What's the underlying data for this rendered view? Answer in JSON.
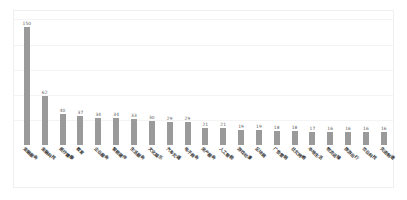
{
  "chart_data": {
    "type": "bar",
    "title": "",
    "subtitle": "",
    "xlabel": "",
    "ylabel": "",
    "ylim": [
      0,
      160
    ],
    "grid": true,
    "legend": false,
    "orientation": "vertical",
    "bar_color": "#9a9a9a",
    "label_rotation_deg": 45,
    "categories": [
      "金融服务",
      "金融科技",
      "医疗健康",
      "教育",
      "企业服务",
      "智能硬件",
      "生活服务",
      "文化娱乐",
      "汽车交通",
      "电子商务",
      "房产服务",
      "人工智能",
      "游戏动漫",
      "区块链",
      "广告营销",
      "社交网络",
      "本地生活",
      "物流运输",
      "旅游出行",
      "农业科技",
      "先进制造"
    ],
    "values": [
      150,
      62,
      40,
      37,
      34,
      34,
      33,
      30,
      29,
      29,
      21,
      21,
      19,
      19,
      18,
      18,
      17,
      16,
      16,
      16,
      16
    ],
    "value_labels": [
      "150",
      "62",
      "40",
      "37",
      "34",
      "34",
      "33",
      "30",
      "29",
      "29",
      "21",
      "21",
      "19",
      "19",
      "18",
      "18",
      "17",
      "16",
      "16",
      "16",
      "16"
    ],
    "gridline_values": [
      150,
      120,
      90,
      60,
      30
    ],
    "accent_colors": {
      "bar": "#9a9a9a",
      "grid": "#f4f4f4",
      "frame": "#efefef",
      "value_text": "#5c5c5c",
      "label_text": "#3a3a3a",
      "background": "#ffffff"
    }
  }
}
